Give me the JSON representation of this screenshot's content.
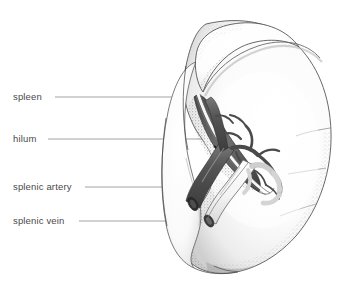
{
  "figure": {
    "background_color": "#ffffff",
    "line_color": "#8a8a8a",
    "outline_color": "#3f3f3f",
    "artery_color": "#5a5a5a",
    "vein_color": "#f2f2f2",
    "text_color": "#4a4a4a",
    "stipple_color": "#9a9a9a"
  },
  "labels": [
    {
      "id": "spleen",
      "text": "spleen",
      "text_x": 13,
      "text_y": 92,
      "leader": {
        "x1": 55,
        "y1": 97,
        "x2": 196,
        "y2": 97
      }
    },
    {
      "id": "hilum",
      "text": "hilum",
      "text_x": 13,
      "text_y": 134,
      "leader": {
        "x1": 48,
        "y1": 139,
        "x2": 226,
        "y2": 139
      }
    },
    {
      "id": "splenic-artery",
      "text": "splenic artery",
      "text_x": 13,
      "text_y": 182,
      "leader": {
        "x1": 85,
        "y1": 187,
        "x2": 207,
        "y2": 187
      }
    },
    {
      "id": "splenic-vein",
      "text": "splenic vein",
      "text_x": 13,
      "text_y": 216,
      "leader": {
        "x1": 79,
        "y1": 221,
        "x2": 198,
        "y2": 221
      }
    }
  ]
}
